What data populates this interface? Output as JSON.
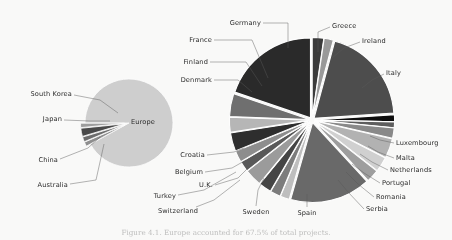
{
  "figure": {
    "caption": "Figure 4.1. Europe accounted for 67.5% of total projects.",
    "background_color": "#fbfbfa",
    "label_color": "#2b2b2b",
    "leader_line_color": "#5a5a5a"
  },
  "chart_data": [
    {
      "type": "pie",
      "name": "regions-pie",
      "title": "",
      "center": [
        129,
        123
      ],
      "radius": 44,
      "start_angle": 180,
      "categories": [
        "Europe",
        "Australia",
        "China",
        "Japan",
        "South Korea"
      ],
      "values": [
        92.0,
        1.6,
        1.8,
        3.0,
        1.6
      ],
      "colors": [
        "#d0d0d0",
        "#8f8f8f",
        "#6d6d6d",
        "#4a4a4a",
        "#9e9e9e"
      ],
      "exploded": [
        false,
        true,
        true,
        true,
        true
      ],
      "inside_labels": [
        "Europe"
      ],
      "legend": "none",
      "grid": false
    },
    {
      "type": "pie",
      "name": "europe-countries-pie",
      "title": "",
      "center": [
        312,
        120
      ],
      "radius": 80,
      "start_angle": -90,
      "categories": [
        "Greece",
        "Ireland",
        "Italy",
        "Luxembourg",
        "Malta",
        "Netherlands",
        "Portugal",
        "Romania",
        "Serbia",
        "Spain",
        "Sweden",
        "Switzerland",
        "Turkey",
        "U.K.",
        "Belgium",
        "Croatia",
        "Denmark",
        "Finland",
        "France",
        "Germany"
      ],
      "values": [
        2.0,
        1.6,
        17.0,
        1.2,
        1.0,
        1.8,
        3.4,
        2.6,
        2.2,
        14.0,
        1.6,
        1.8,
        2.2,
        3.0,
        1.8,
        2.0,
        3.2,
        2.6,
        4.0,
        17.0
      ],
      "colors": [
        "#3a3a3a",
        "#9a9a9a",
        "#4e4e4e",
        "#111111",
        "#5f5f5f",
        "#8a8a8a",
        "#b4b4b4",
        "#d2d2d2",
        "#9f9f9f",
        "#6a6a6a",
        "#c0c0c0",
        "#7d7d7d",
        "#454545",
        "#9c9c9c",
        "#5a5a5a",
        "#8e8e8e",
        "#2e2e2e",
        "#b8b8b8",
        "#6f6f6f",
        "#2a2a2a"
      ],
      "exploded_all": true,
      "legend": "none",
      "grid": false
    }
  ],
  "labels": [
    {
      "text": "South Korea",
      "x": 72,
      "y": 94,
      "align": "r"
    },
    {
      "text": "Japan",
      "x": 62,
      "y": 119,
      "align": "r"
    },
    {
      "text": "China",
      "x": 58,
      "y": 160,
      "align": "r"
    },
    {
      "text": "Australia",
      "x": 68,
      "y": 185,
      "align": "r"
    },
    {
      "text": "Europe",
      "x": 143,
      "y": 122,
      "align": "c"
    },
    {
      "text": "Denmark",
      "x": 212,
      "y": 80,
      "align": "r"
    },
    {
      "text": "Finland",
      "x": 208,
      "y": 62,
      "align": "r"
    },
    {
      "text": "France",
      "x": 212,
      "y": 40,
      "align": "r"
    },
    {
      "text": "Germany",
      "x": 261,
      "y": 23,
      "align": "r"
    },
    {
      "text": "Greece",
      "x": 332,
      "y": 26,
      "align": "l"
    },
    {
      "text": "Ireland",
      "x": 362,
      "y": 41,
      "align": "l"
    },
    {
      "text": "Italy",
      "x": 386,
      "y": 73,
      "align": "l"
    },
    {
      "text": "Luxembourg",
      "x": 396,
      "y": 143,
      "align": "l"
    },
    {
      "text": "Malta",
      "x": 396,
      "y": 158,
      "align": "l"
    },
    {
      "text": "Netherlands",
      "x": 390,
      "y": 170,
      "align": "l"
    },
    {
      "text": "Portugal",
      "x": 382,
      "y": 183,
      "align": "l"
    },
    {
      "text": "Romania",
      "x": 376,
      "y": 197,
      "align": "l"
    },
    {
      "text": "Serbia",
      "x": 366,
      "y": 209,
      "align": "l"
    },
    {
      "text": "Spain",
      "x": 307,
      "y": 213,
      "align": "c"
    },
    {
      "text": "Sweden",
      "x": 256,
      "y": 212,
      "align": "c"
    },
    {
      "text": "Switzerland",
      "x": 178,
      "y": 211,
      "align": "c"
    },
    {
      "text": "Turkey",
      "x": 176,
      "y": 196,
      "align": "r"
    },
    {
      "text": "U.K.",
      "x": 213,
      "y": 185,
      "align": "r"
    },
    {
      "text": "Belgium",
      "x": 203,
      "y": 172,
      "align": "r"
    },
    {
      "text": "Croatia",
      "x": 205,
      "y": 155,
      "align": "r"
    }
  ],
  "leaders": [
    {
      "name": "leader-south-korea",
      "points": "74,95 100,100 118,113"
    },
    {
      "name": "leader-japan",
      "points": "64,120 90,121 110,121"
    },
    {
      "name": "leader-china",
      "points": "60,159 88,148 100,137"
    },
    {
      "name": "leader-australia",
      "points": "70,184 96,180 104,144"
    },
    {
      "name": "leader-denmark",
      "points": "214,80 238,80 252,92"
    },
    {
      "name": "leader-finland",
      "points": "210,62 246,62 262,86"
    },
    {
      "name": "leader-france",
      "points": "214,40 252,40 268,78"
    },
    {
      "name": "leader-germany",
      "points": "263,23 288,23 288,48"
    },
    {
      "name": "leader-greece",
      "points": "330,27 318,32 318,52"
    },
    {
      "name": "leader-ireland",
      "points": "360,42 344,48 332,58"
    },
    {
      "name": "leader-italy",
      "points": "384,74 372,80 362,88"
    },
    {
      "name": "leader-luxembourg",
      "points": "394,143 380,140 370,136"
    },
    {
      "name": "leader-malta",
      "points": "394,158 378,152 368,146"
    },
    {
      "name": "leader-netherlands",
      "points": "388,170 372,162 360,154"
    },
    {
      "name": "leader-portugal",
      "points": "380,183 364,173 352,164"
    },
    {
      "name": "leader-romania",
      "points": "374,197 358,184 346,172"
    },
    {
      "name": "leader-serbia",
      "points": "364,209 348,192 338,180"
    },
    {
      "name": "leader-spain",
      "points": "307,207 307,194"
    },
    {
      "name": "leader-sweden",
      "points": "256,206 258,190 264,178"
    },
    {
      "name": "leader-switzerland",
      "points": "196,207 214,200 240,180"
    },
    {
      "name": "leader-turkey",
      "points": "178,195 204,190 236,172"
    },
    {
      "name": "leader-uk",
      "points": "215,185 238,178 248,168"
    },
    {
      "name": "leader-belgium",
      "points": "205,172 232,168 246,160"
    },
    {
      "name": "leader-croatia",
      "points": "207,155 234,152 244,148"
    }
  ]
}
